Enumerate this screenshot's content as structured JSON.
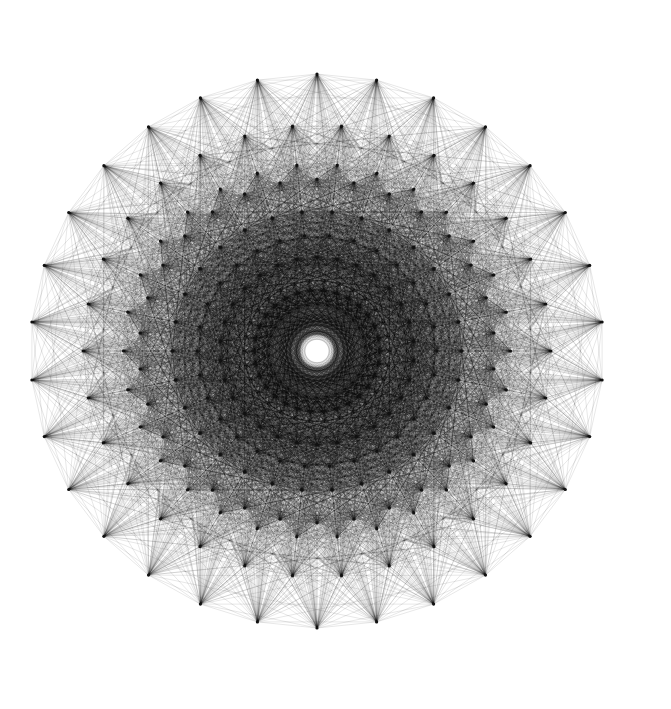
{
  "figure": {
    "type": "polytope-projection",
    "symmetry_polygon": 30,
    "center": {
      "x": 317,
      "y": 351
    },
    "x_scale": 1.035,
    "background": "#ffffff",
    "edge_color": "#000000",
    "vertex_color": "#111111",
    "rings": [
      {
        "radius": 277,
        "phase_half_step": false
      },
      {
        "radius": 226,
        "phase_half_step": true
      },
      {
        "radius": 187,
        "phase_half_step": true
      },
      {
        "radius": 172,
        "phase_half_step": false
      },
      {
        "radius": 140,
        "phase_half_step": true
      },
      {
        "radius": 116,
        "phase_half_step": true
      },
      {
        "radius": 94,
        "phase_half_step": false
      },
      {
        "radius": 61,
        "phase_half_step": true
      }
    ],
    "center_hole_radius": 6
  }
}
